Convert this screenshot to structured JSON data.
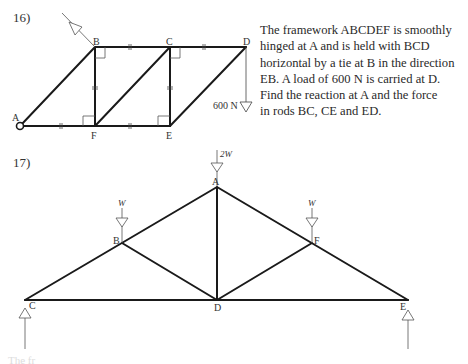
{
  "problems": [
    {
      "number": "16)",
      "text_lines": [
        "The framework ABCDEF is smoothly",
        "hinged at A and is held with BCD",
        "horizontal by a tie at B in the direction",
        "EB. A load of 600 N is carried at D.",
        "Find the reaction at A and the force",
        "in rods BC, CE and ED."
      ],
      "diagram": {
        "nodes": {
          "A": "A",
          "B": "B",
          "C": "C",
          "D": "D",
          "E": "E",
          "F": "F"
        },
        "load_label": "600 N",
        "hinge_node": "A",
        "tie_node": "B"
      }
    },
    {
      "number": "17)",
      "diagram": {
        "nodes": {
          "A": "A",
          "B": "B",
          "C": "C",
          "D": "D",
          "E": "E",
          "F": "F"
        },
        "loads": {
          "A": "2W",
          "B": "W",
          "F": "W"
        },
        "supports": [
          "C",
          "E"
        ]
      }
    }
  ],
  "footer_fragment": "The fr"
}
